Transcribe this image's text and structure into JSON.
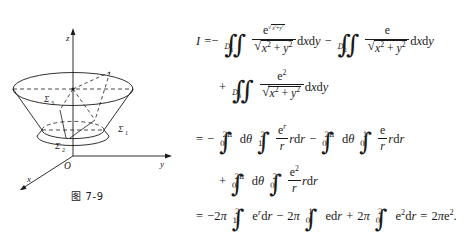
{
  "page": {
    "background": "#ffffff",
    "ink": "#1a1a1a"
  },
  "figure": {
    "caption": "图 7-9",
    "axes": [
      {
        "name": "z-axis-label",
        "label": "z"
      },
      {
        "name": "y-axis-label",
        "label": "y"
      },
      {
        "name": "x-axis-label",
        "label": "x"
      },
      {
        "name": "origin-label",
        "label": "O"
      }
    ],
    "surface_labels": [
      {
        "name": "sigma-1",
        "label": "Σ",
        "sub": "1"
      },
      {
        "name": "sigma-2",
        "label": "Σ",
        "sub": "2"
      },
      {
        "name": "sigma-3",
        "label": "Σ",
        "sub": "3"
      }
    ]
  },
  "equation": {
    "lhs": "I",
    "lines": [
      {
        "id": "line-1",
        "text": "I = -∬_{D₁} e^{√(x²+y²)}/√(x²+y²) dxdy - ∬_{D₂} e/√(x²+y²) dxdy",
        "relation": "=",
        "domains": [
          "D",
          "D"
        ],
        "domain_subs": [
          "1",
          "2"
        ],
        "differential": "dxdy"
      },
      {
        "id": "line-2",
        "text": "+ ∬_{D₃} e²/√(x²+y²) dxdy",
        "leading_op": "+",
        "domain": "D",
        "domain_sub": "3",
        "differential": "dxdy"
      },
      {
        "id": "line-3",
        "text": "= - ∫₀^{2π} dθ ∫₁² (eʳ/r) r dr - ∫₀^{2π} dθ ∫₀¹ (e/r) r dr",
        "relation": "=",
        "leading_op": "-",
        "theta_limits": [
          "0",
          "2π"
        ],
        "r_limits_first": [
          "1",
          "2"
        ],
        "r_limits_second": [
          "0",
          "1"
        ],
        "differential_theta": "dθ",
        "differential_r": "dr"
      },
      {
        "id": "line-4",
        "text": "+ ∫₀^{2π} dθ ∫₀² (e²/r) r dr",
        "leading_op": "+",
        "theta_limits": [
          "0",
          "2π"
        ],
        "r_limits": [
          "0",
          "2"
        ],
        "differential_theta": "dθ",
        "differential_r": "dr"
      },
      {
        "id": "line-5",
        "text": "= -2π ∫₁² eʳ dr - 2π ∫₀¹ e dr + 2π ∫₀² e² dr = 2πe².",
        "relation": "=",
        "coefficients": [
          "-2π",
          "-2π",
          "+2π"
        ],
        "limits": [
          [
            "1",
            "2"
          ],
          [
            "0",
            "1"
          ],
          [
            "0",
            "2"
          ]
        ],
        "result": "2πe²",
        "terminator": "."
      }
    ],
    "symbols": {
      "double_integral": "∬",
      "single_integral": "∫",
      "radical": "√",
      "theta": "θ",
      "pi": "π",
      "sigma": "Σ",
      "euler_e": "e",
      "radius": "r"
    }
  }
}
